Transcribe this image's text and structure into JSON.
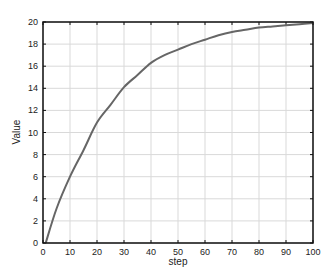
{
  "chart_data": {
    "type": "line",
    "title": "",
    "xlabel": "step",
    "ylabel": "Value",
    "xlim": [
      0,
      100
    ],
    "ylim": [
      0,
      20
    ],
    "xticks": [
      0,
      10,
      20,
      30,
      40,
      50,
      60,
      70,
      80,
      90,
      100
    ],
    "yticks": [
      0,
      2,
      4,
      6,
      8,
      10,
      12,
      14,
      16,
      18,
      20
    ],
    "grid": true,
    "legend": null,
    "series": [
      {
        "name": "Value",
        "color": "#666666",
        "x": [
          1,
          5,
          10,
          15,
          20,
          25,
          30,
          35,
          40,
          45,
          50,
          55,
          60,
          65,
          70,
          75,
          80,
          85,
          90,
          95,
          100
        ],
        "y": [
          0,
          3.1,
          6.0,
          8.4,
          10.9,
          12.5,
          14.1,
          15.2,
          16.3,
          17.0,
          17.5,
          18.0,
          18.4,
          18.8,
          19.1,
          19.3,
          19.5,
          19.6,
          19.7,
          19.8,
          19.9
        ]
      }
    ]
  }
}
